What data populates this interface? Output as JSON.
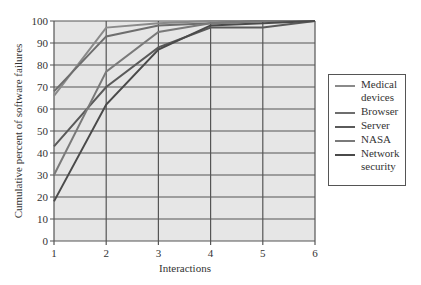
{
  "chart_data": {
    "type": "line",
    "title": "",
    "xlabel": "Interactions",
    "ylabel": "Cumulative percent of software failures",
    "x": [
      1,
      2,
      3,
      4,
      5,
      6
    ],
    "xlim": [
      1,
      6
    ],
    "ylim": [
      0,
      100
    ],
    "x_ticks": [
      "1",
      "2",
      "3",
      "4",
      "5",
      "6"
    ],
    "y_ticks": [
      "0",
      "10",
      "20",
      "30",
      "40",
      "50",
      "60",
      "70",
      "80",
      "90",
      "100"
    ],
    "grid": true,
    "legend_position": "right",
    "series": [
      {
        "name": "Medical devices",
        "color": "#8a8a8a",
        "values": [
          66,
          97,
          99,
          100,
          100,
          100
        ]
      },
      {
        "name": "Browser",
        "color": "#6e6e6e",
        "values": [
          68,
          93,
          98,
          99,
          100,
          100
        ]
      },
      {
        "name": "Server",
        "color": "#5a5a5a",
        "values": [
          43,
          70,
          88,
          97,
          97,
          100
        ]
      },
      {
        "name": "NASA",
        "color": "#7a7a7a",
        "values": [
          30,
          77,
          95,
          99,
          100,
          100
        ]
      },
      {
        "name": "Network security",
        "color": "#4a4a4a",
        "values": [
          18,
          62,
          87,
          98,
          99,
          100
        ]
      }
    ]
  },
  "legend": {
    "items": [
      {
        "label": "Medical devices",
        "color": "#8a8a8a"
      },
      {
        "label": "Browser",
        "color": "#6e6e6e"
      },
      {
        "label": "Server",
        "color": "#5a5a5a"
      },
      {
        "label": "NASA",
        "color": "#7a7a7a"
      },
      {
        "label": "Network security",
        "color": "#4a4a4a"
      }
    ]
  },
  "style": {
    "plot_background": "#e6e6e6",
    "grid_color": "#555555"
  }
}
